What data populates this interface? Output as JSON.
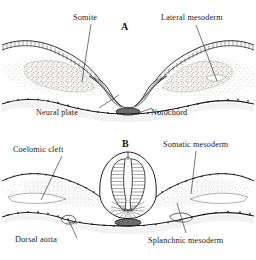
{
  "figure": {
    "type": "anatomical-illustration",
    "background_color": "#ffffff",
    "ink_color": "#1a1a1a"
  },
  "panels": [
    {
      "letter": "A",
      "description": "Neural plate stage: open neural groove flanked by somites and lateral mesoderm",
      "labels": [
        {
          "id": "somite",
          "text": "Somite"
        },
        {
          "id": "lateral_mesoderm",
          "text": "Lateral mesoderm"
        },
        {
          "id": "neural_plate",
          "text": "Neural plate"
        },
        {
          "id": "notochord",
          "text": "Notochord"
        }
      ]
    },
    {
      "letter": "B",
      "description": "Neural tube closing stage: coelomic cleft splits lateral mesoderm into somatic and splanchnic layers",
      "labels": [
        {
          "id": "coelomic_cleft",
          "text": "Coelomic cleft"
        },
        {
          "id": "somatic_mesoderm",
          "text": "Somatic mesoderm"
        },
        {
          "id": "dorsal_aorta",
          "text": "Dorsal aorta"
        },
        {
          "id": "splanchnic_mesoderm",
          "text": "Splanchnic mesoderm"
        }
      ]
    }
  ]
}
